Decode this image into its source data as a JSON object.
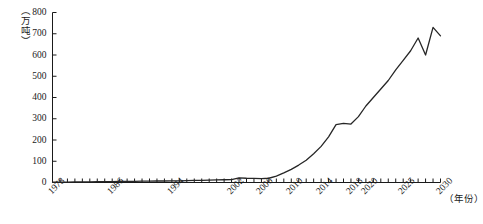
{
  "chart_data": {
    "type": "line",
    "title": "",
    "xlabel": "（年份）",
    "ylabel": "（万吨）",
    "xlim": [
      1978,
      2030
    ],
    "ylim": [
      0,
      800
    ],
    "grid": false,
    "legend": "none",
    "y_ticks": [
      0,
      100,
      200,
      300,
      400,
      500,
      600,
      700,
      800
    ],
    "x_tick_labels": [
      "1978",
      "1986",
      "1994",
      "2002",
      "2006",
      "2010",
      "2014",
      "2018",
      "2020",
      "2025",
      "2030"
    ],
    "x_tick_label_years": [
      1978,
      1986,
      1994,
      2002,
      2006,
      2010,
      2014,
      2018,
      2020,
      2025,
      2030
    ],
    "x_minor_tick_step": 1,
    "series": [
      {
        "name": "产量",
        "color": "#262626",
        "x": [
          1978,
          1979,
          1980,
          1981,
          1982,
          1983,
          1984,
          1985,
          1986,
          1987,
          1988,
          1989,
          1990,
          1991,
          1992,
          1993,
          1994,
          1995,
          1996,
          1997,
          1998,
          1999,
          2000,
          2001,
          2002,
          2003,
          2004,
          2005,
          2006,
          2007,
          2008,
          2009,
          2010,
          2011,
          2012,
          2013,
          2014,
          2015,
          2016,
          2017,
          2018,
          2019,
          2020,
          2021,
          2022,
          2023,
          2024,
          2025,
          2026,
          2027,
          2028,
          2029,
          2030
        ],
        "y": [
          2,
          2,
          2,
          3,
          3,
          3,
          4,
          4,
          4,
          5,
          5,
          5,
          6,
          6,
          7,
          7,
          8,
          8,
          9,
          10,
          10,
          11,
          12,
          13,
          14,
          22,
          20,
          19,
          18,
          20,
          30,
          45,
          62,
          82,
          105,
          135,
          170,
          215,
          272,
          278,
          275,
          310,
          360,
          400,
          440,
          480,
          530,
          575,
          620,
          680,
          600,
          730,
          690
        ]
      }
    ]
  },
  "axes": {
    "y_unit_note": "（万吨）",
    "x_unit_note": "（年份）"
  }
}
